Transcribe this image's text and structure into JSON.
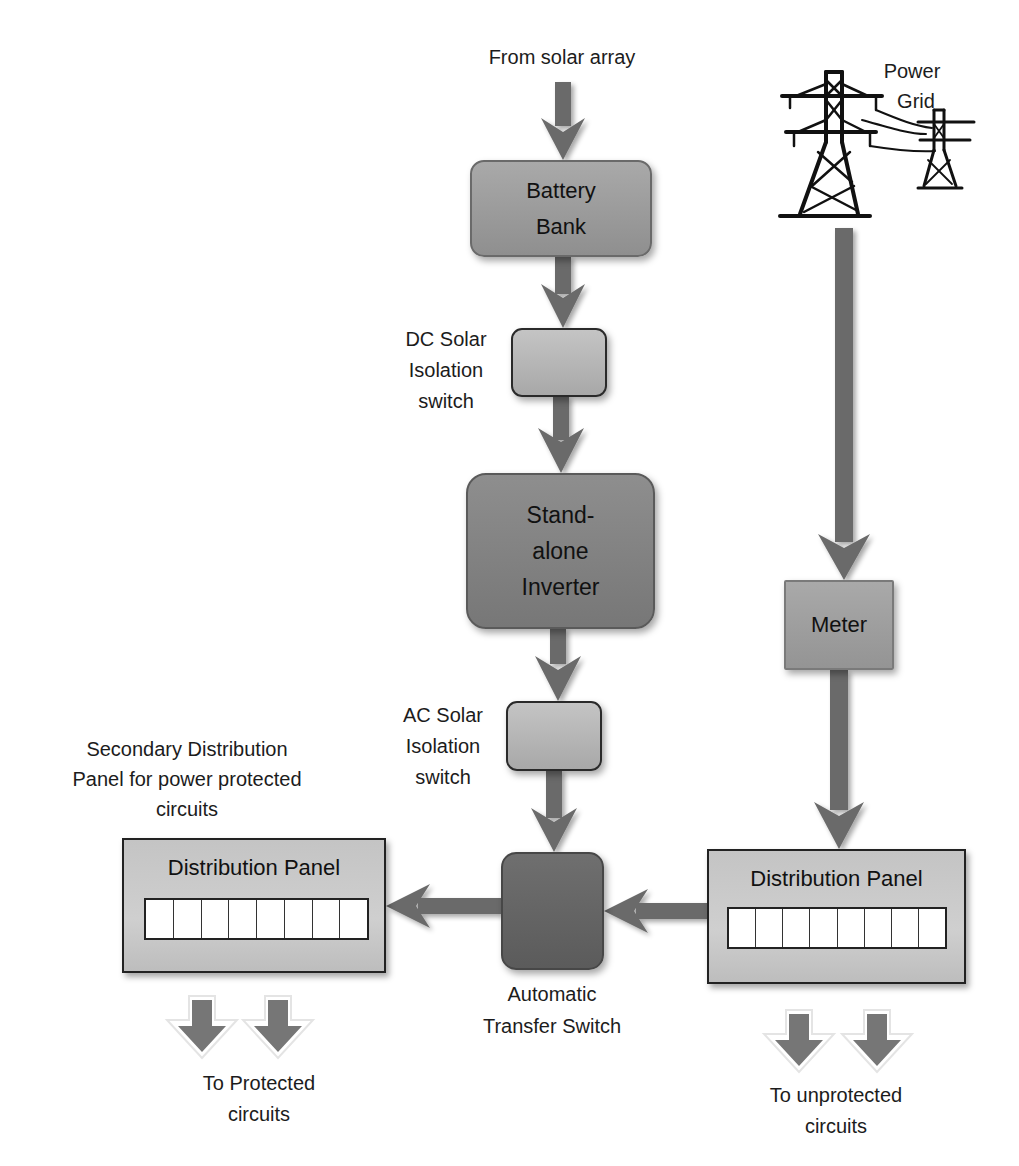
{
  "diagram": {
    "type": "power-flow",
    "sources": {
      "solar": {
        "label": "From solar array"
      },
      "grid": {
        "label_line1": "Power",
        "label_line2": "Grid",
        "icon": "power-pylon-icon"
      }
    },
    "nodes": {
      "battery_bank": {
        "line1": "Battery",
        "line2": "Bank"
      },
      "dc_switch": {
        "line1": "DC Solar",
        "line2": "Isolation",
        "line3": "switch"
      },
      "inverter": {
        "line1": "Stand-",
        "line2": "alone",
        "line3": "Inverter"
      },
      "ac_switch": {
        "line1": "AC Solar",
        "line2": "Isolation",
        "line3": "switch"
      },
      "ats": {
        "line1": "Automatic",
        "line2": "Transfer Switch"
      },
      "meter": {
        "label": "Meter"
      },
      "panel_left": {
        "title": "Distribution Panel",
        "breaker_count": 8,
        "caption_line1": "Secondary Distribution",
        "caption_line2": "Panel for power protected",
        "caption_line3": "circuits"
      },
      "panel_right": {
        "title": "Distribution Panel",
        "breaker_count": 8
      }
    },
    "outputs": {
      "protected": {
        "line1": "To Protected",
        "line2": "circuits"
      },
      "unprotected": {
        "line1": "To unprotected",
        "line2": "circuits"
      }
    },
    "edges": [
      {
        "from": "solar",
        "to": "battery_bank"
      },
      {
        "from": "battery_bank",
        "to": "dc_switch"
      },
      {
        "from": "dc_switch",
        "to": "inverter"
      },
      {
        "from": "inverter",
        "to": "ac_switch"
      },
      {
        "from": "ac_switch",
        "to": "ats"
      },
      {
        "from": "grid",
        "to": "meter"
      },
      {
        "from": "meter",
        "to": "panel_right"
      },
      {
        "from": "panel_right",
        "to": "ats"
      },
      {
        "from": "ats",
        "to": "panel_left"
      },
      {
        "from": "panel_left",
        "to": "protected"
      },
      {
        "from": "panel_right",
        "to": "unprotected"
      }
    ],
    "colors": {
      "arrow": "#6b6b6b",
      "battery_fill": "#9c9c9c",
      "switch_fill": "#b6b6b6",
      "inverter_fill": "#828282",
      "ats_fill": "#656565",
      "meter_fill": "#9f9f9f",
      "panel_fill": "#c8c8c8",
      "breaker_fill": "#ffffff"
    }
  }
}
